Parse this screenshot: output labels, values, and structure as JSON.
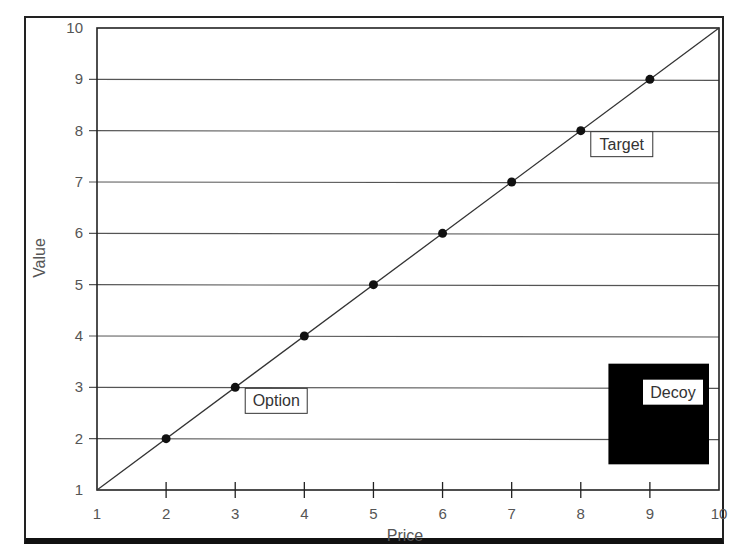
{
  "chart_data": {
    "type": "scatter",
    "title": "",
    "xlabel": "Price",
    "ylabel": "Value",
    "xlim": [
      1,
      10
    ],
    "ylim": [
      1,
      10
    ],
    "x_ticks": [
      1,
      2,
      3,
      4,
      5,
      6,
      7,
      8,
      9,
      10
    ],
    "y_ticks": [
      1,
      2,
      3,
      4,
      5,
      6,
      7,
      8,
      9,
      10
    ],
    "grid": "horizontal",
    "series": [
      {
        "name": "points",
        "x": [
          2,
          3,
          4,
          5,
          6,
          7,
          8,
          9
        ],
        "y": [
          2,
          3,
          4,
          5,
          6,
          7,
          8,
          9
        ]
      }
    ],
    "reference_line": {
      "from": [
        1,
        1
      ],
      "to": [
        10,
        10
      ]
    },
    "annotations": [
      {
        "label": "Option",
        "x": 3,
        "y": 3
      },
      {
        "label": "Target",
        "x": 8,
        "y": 8
      },
      {
        "label": "Decoy",
        "region": {
          "x0": 8.4,
          "x1": 10,
          "y0": 1.5,
          "y1": 3.5
        },
        "style": "filled-black"
      }
    ]
  },
  "colors": {
    "axis": "#222222",
    "grid": "#555555",
    "point": "#111111",
    "decoy_fill": "#000000",
    "label_text": "#555555"
  }
}
